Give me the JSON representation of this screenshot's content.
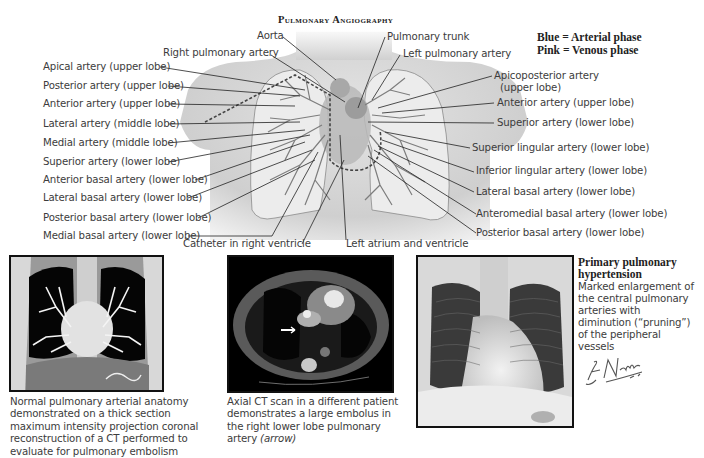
{
  "figure": {
    "title": "Pulmonary Angiography",
    "legend": {
      "line1": "Blue = Arterial phase",
      "line2": "Pink = Venous phase"
    },
    "illustration": {
      "top_labels": {
        "aorta": "Aorta",
        "right_pulmonary_artery": "Right pulmonary artery",
        "pulmonary_trunk": "Pulmonary trunk",
        "left_pulmonary_artery": "Left pulmonary artery"
      },
      "left_labels": [
        "Apical artery (upper lobe)",
        "Posterior artery (upper lobe)",
        "Anterior artery (upper lobe)",
        "Lateral artery (middle lobe)",
        "Medial artery (middle lobe)",
        "Superior artery (lower lobe)",
        "Anterior basal artery (lower lobe)",
        "Lateral basal artery (lower lobe)",
        "Posterior basal artery (lower lobe)",
        "Medial basal artery (lower lobe)"
      ],
      "right_labels": [
        "Apicoposterior artery",
        "(upper lobe)",
        "Anterior artery (upper lobe)",
        "Superior artery (lower lobe)",
        "Superior lingular artery (lower lobe)",
        "Inferior lingular artery (lower lobe)",
        "Lateral basal artery (lower lobe)",
        "Anteromedial basal artery (lower lobe)",
        "Posterior basal artery (lower lobe)"
      ],
      "bottom_labels": {
        "catheter": "Catheter in right ventricle",
        "left_atrium": "Left atrium and ventricle"
      }
    },
    "panels": [
      {
        "image": "coronal-mip-ct-image",
        "caption": "Normal pulmonary arterial anatomy demonstrated on a thick section maximum intensity projection coronal reconstruction of a CT performed to evaluate for pulmonary embolism"
      },
      {
        "image": "axial-ct-image",
        "caption": "Axial CT scan in a different patient demonstrates a large embolus in the right lower lobe pulmonary artery",
        "caption_italic": "(arrow)"
      },
      {
        "image": "chest-xray-image",
        "heading_line1": "Primary pulmonary",
        "heading_line2": "hypertension",
        "description": "Marked enlargement of the central pulmonary arteries with diminution (“pruning”) of the peripheral vessels",
        "signature": "F. Netter M.D."
      }
    ]
  }
}
